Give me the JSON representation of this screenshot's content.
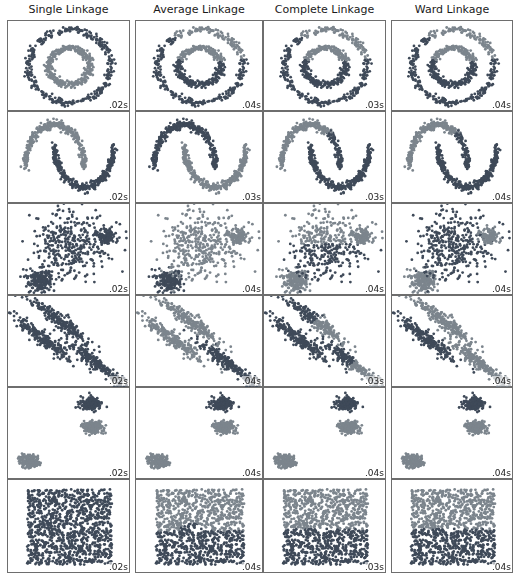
{
  "chart_data": {
    "type": "scatter",
    "columns": [
      "Single Linkage",
      "Average Linkage",
      "Complete Linkage",
      "Ward Linkage"
    ],
    "rows": [
      "noisy_circles",
      "noisy_moons",
      "varied",
      "aniso",
      "blobs",
      "no_structure"
    ],
    "timings": [
      [
        ".02s",
        ".04s",
        ".03s",
        ".04s"
      ],
      [
        ".02s",
        ".03s",
        ".03s",
        ".04s"
      ],
      [
        ".02s",
        ".04s",
        ".04s",
        ".04s"
      ],
      [
        ".02s",
        ".04s",
        ".03s",
        ".04s"
      ],
      [
        ".02s",
        ".04s",
        ".04s",
        ".04s"
      ],
      [
        ".02s",
        ".04s",
        ".03s",
        ".04s"
      ]
    ],
    "colors": {
      "dark": "#3f4a59",
      "light": "#7c858d",
      "mid": "#5a6470"
    },
    "axes": "off",
    "grid": false,
    "legend": "none"
  },
  "titles": {
    "single": "Single Linkage",
    "average": "Average Linkage",
    "complete": "Complete Linkage",
    "ward": "Ward Linkage"
  }
}
